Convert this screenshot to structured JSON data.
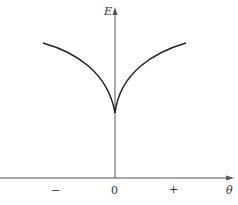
{
  "diagram": {
    "y_axis_label": "E",
    "x_axis_label": "θ",
    "x_ticks": [
      {
        "label": "−",
        "x": 55
      },
      {
        "label": "0",
        "x": 115
      },
      {
        "label": "+",
        "x": 173
      }
    ],
    "curve": "cusp-shaped energy curve with minimum at θ=0, rising to both sides",
    "colors": {
      "axis": "#555555",
      "curve": "#222222",
      "background": "#ffffff"
    }
  }
}
